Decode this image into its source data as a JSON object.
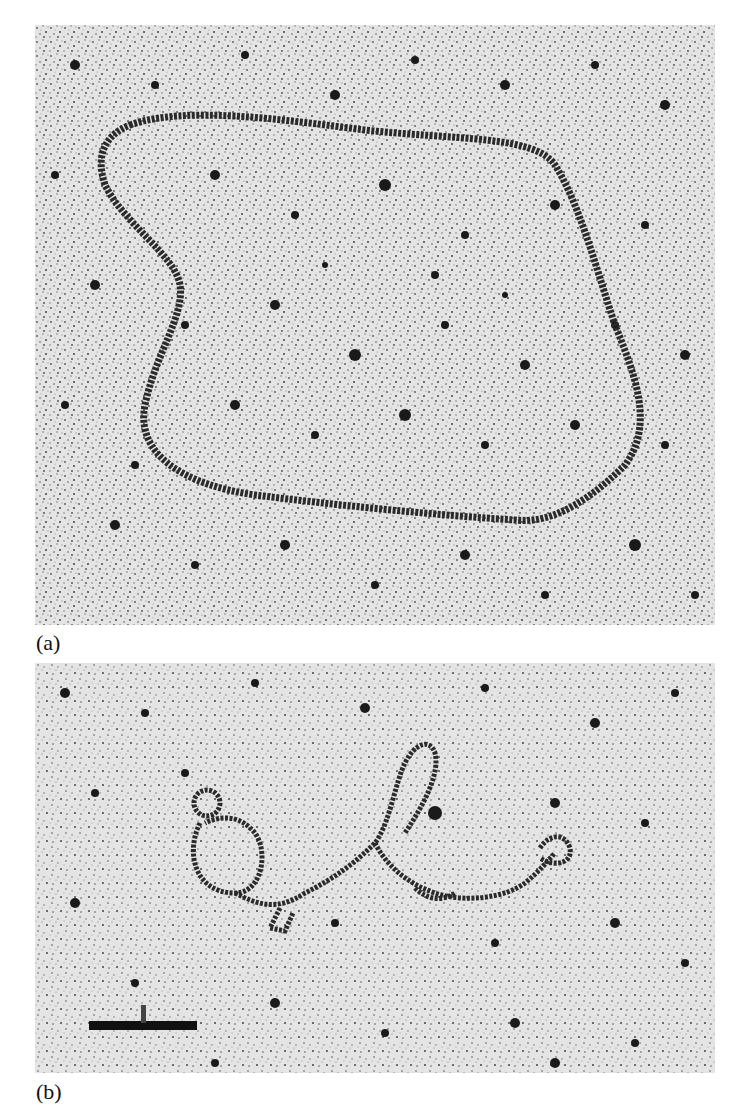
{
  "figure": {
    "panels": [
      {
        "id": "a",
        "label": "(a)",
        "description": "Electron micrograph of a large relaxed circular DNA molecule on a speckled background"
      },
      {
        "id": "b",
        "label": "(b)",
        "description": "Electron micrograph of a twisted, partially supercoiled DNA molecule with small loops",
        "scale_bar": {
          "present": true,
          "label": ""
        }
      }
    ],
    "colors": {
      "background": "#ffffff",
      "micrograph_base": "#e6e6e6",
      "strand": "#2a2a2a",
      "speckle": "#1a1a1a"
    }
  }
}
